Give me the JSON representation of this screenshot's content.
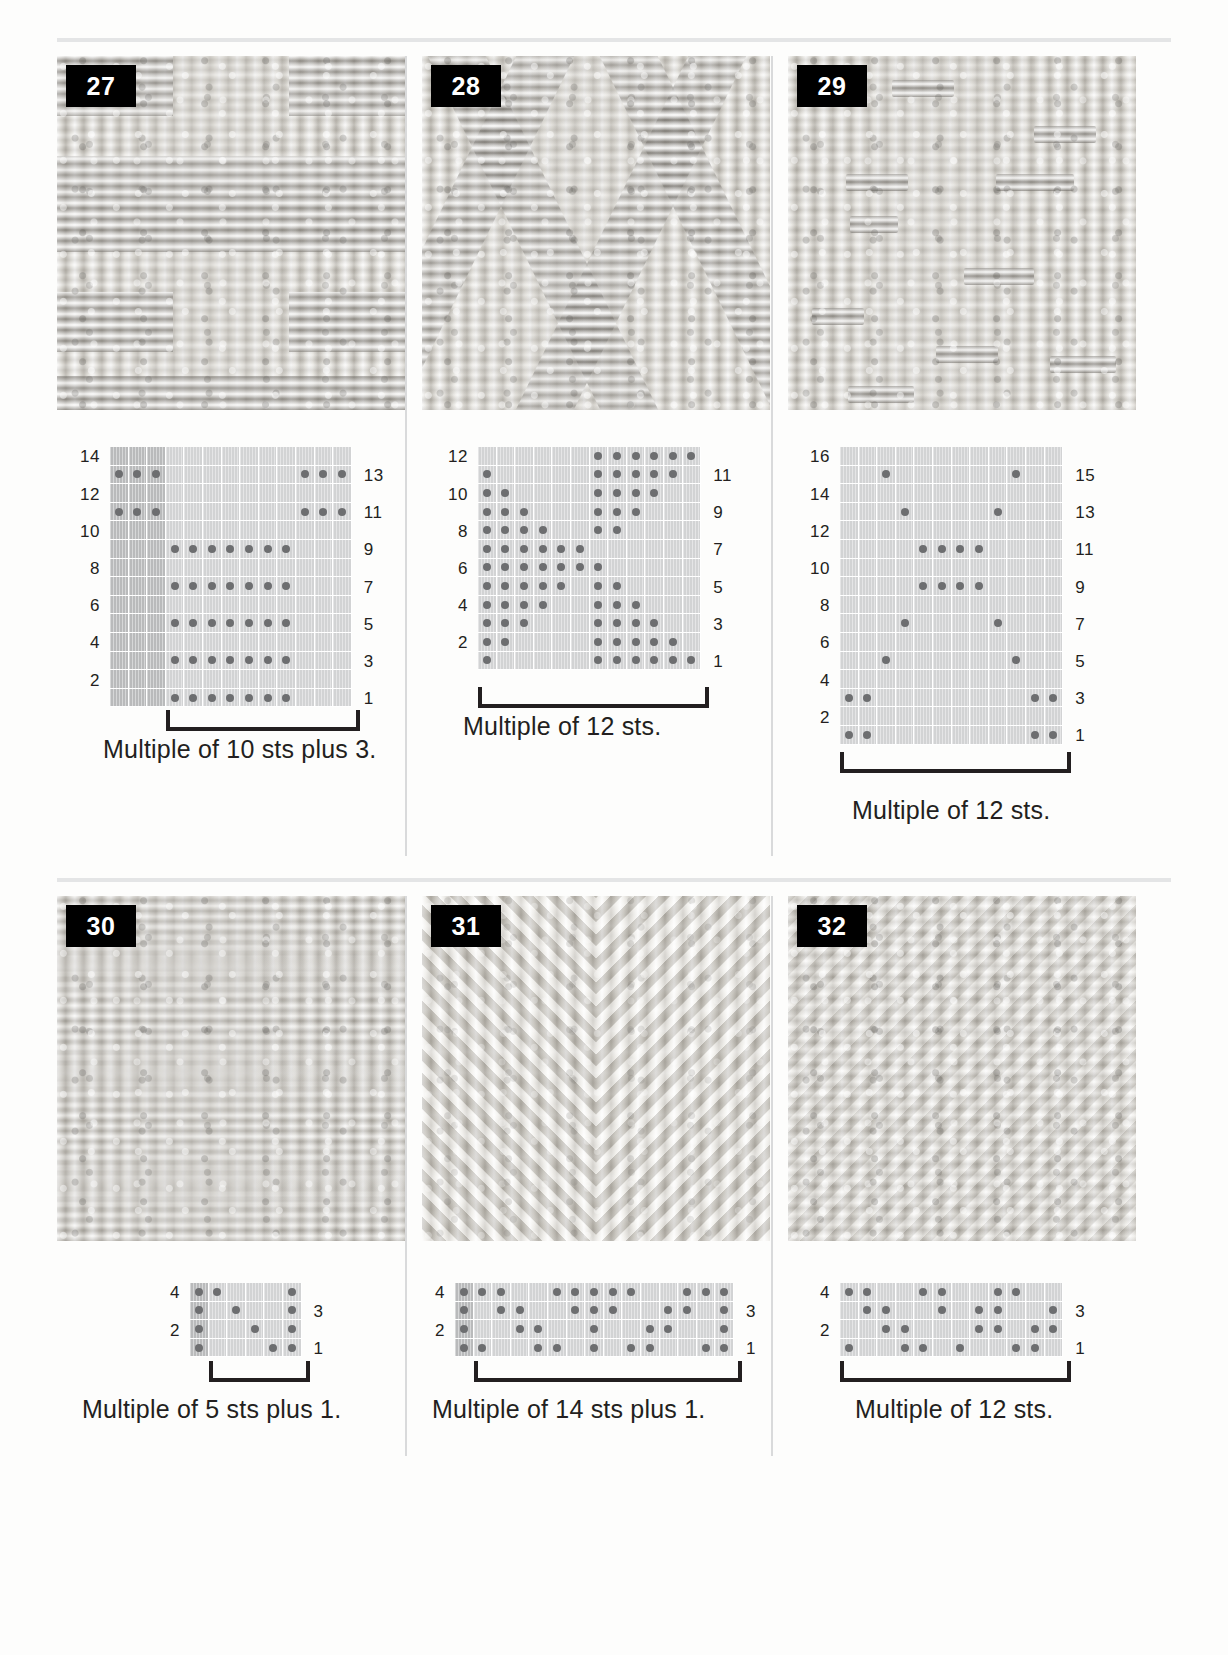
{
  "page": {
    "swatch_count": 6
  },
  "panels": [
    {
      "id": "panel-27",
      "number": "27",
      "caption": "Multiple of 10 sts plus 3.",
      "chart": {
        "columns": 13,
        "rows": 14,
        "shaded_columns": [
          1,
          2,
          3
        ],
        "left_labels": [
          "2",
          "4",
          "6",
          "8",
          "10",
          "12",
          "14"
        ],
        "right_labels": [
          "1",
          "3",
          "5",
          "7",
          "9",
          "11",
          "13"
        ],
        "repeat_start_col": 4,
        "repeat_end_col": 13,
        "dots": {
          "1": [
            4,
            5,
            6,
            7,
            8,
            9,
            10
          ],
          "2": [],
          "3": [
            4,
            5,
            6,
            7,
            8,
            9,
            10
          ],
          "4": [],
          "5": [
            4,
            5,
            6,
            7,
            8,
            9,
            10
          ],
          "6": [],
          "7": [
            4,
            5,
            6,
            7,
            8,
            9,
            10
          ],
          "8": [],
          "9": [
            4,
            5,
            6,
            7,
            8,
            9,
            10
          ],
          "10": [],
          "11": [
            1,
            2,
            3,
            11,
            12,
            13
          ],
          "12": [],
          "13": [
            1,
            2,
            3,
            11,
            12,
            13
          ],
          "14": []
        }
      }
    },
    {
      "id": "panel-28",
      "number": "28",
      "caption": "Multiple of 12 sts.",
      "chart": {
        "columns": 12,
        "rows": 12,
        "shaded_columns": [],
        "left_labels": [
          "2",
          "4",
          "6",
          "8",
          "10",
          "12"
        ],
        "right_labels": [
          "1",
          "3",
          "5",
          "7",
          "9",
          "11"
        ],
        "repeat_start_col": 1,
        "repeat_end_col": 12,
        "dots": {
          "1": [
            1,
            7,
            8,
            9,
            10,
            11,
            12
          ],
          "2": [
            1,
            2,
            7,
            8,
            9,
            10,
            11
          ],
          "3": [
            1,
            2,
            3,
            7,
            8,
            9,
            10
          ],
          "4": [
            1,
            2,
            3,
            4,
            7,
            8,
            9
          ],
          "5": [
            1,
            2,
            3,
            4,
            5,
            7,
            8
          ],
          "6": [
            1,
            2,
            3,
            4,
            5,
            6,
            7
          ],
          "7": [
            1,
            2,
            3,
            4,
            5,
            6
          ],
          "8": [
            1,
            2,
            3,
            4,
            7,
            8
          ],
          "9": [
            1,
            2,
            3,
            7,
            8,
            9
          ],
          "10": [
            1,
            2,
            7,
            8,
            9,
            10
          ],
          "11": [
            1,
            7,
            8,
            9,
            10,
            11
          ],
          "12": [
            7,
            8,
            9,
            10,
            11,
            12
          ]
        }
      }
    },
    {
      "id": "panel-29",
      "number": "29",
      "caption": "Multiple of 12 sts.",
      "chart": {
        "columns": 12,
        "rows": 16,
        "shaded_columns": [],
        "left_labels": [
          "2",
          "4",
          "6",
          "8",
          "10",
          "12",
          "14",
          "16"
        ],
        "right_labels": [
          "1",
          "3",
          "5",
          "7",
          "9",
          "11",
          "13",
          "15"
        ],
        "repeat_start_col": 1,
        "repeat_end_col": 12,
        "dots": {
          "1": [
            1,
            2,
            11,
            12
          ],
          "2": [],
          "3": [
            1,
            2,
            11,
            12
          ],
          "4": [],
          "5": [
            3,
            10
          ],
          "6": [],
          "7": [
            4,
            9
          ],
          "8": [],
          "9": [
            5,
            6,
            7,
            8
          ],
          "10": [],
          "11": [
            5,
            6,
            7,
            8
          ],
          "12": [],
          "13": [
            4,
            9
          ],
          "14": [],
          "15": [
            3,
            10
          ],
          "16": []
        }
      }
    },
    {
      "id": "panel-30",
      "number": "30",
      "caption": "Multiple of 5 sts plus 1.",
      "chart": {
        "columns": 6,
        "rows": 4,
        "shaded_columns": [
          1
        ],
        "left_labels": [
          "2",
          "4"
        ],
        "right_labels": [
          "1",
          "3"
        ],
        "repeat_start_col": 2,
        "repeat_end_col": 6,
        "dots": {
          "1": [
            1,
            5,
            6
          ],
          "2": [
            1,
            4,
            6
          ],
          "3": [
            1,
            3,
            6
          ],
          "4": [
            1,
            2,
            6
          ]
        }
      }
    },
    {
      "id": "panel-31",
      "number": "31",
      "caption": "Multiple of 14 sts plus 1.",
      "chart": {
        "columns": 15,
        "rows": 4,
        "shaded_columns": [
          1
        ],
        "left_labels": [
          "2",
          "4"
        ],
        "right_labels": [
          "1",
          "3"
        ],
        "repeat_start_col": 2,
        "repeat_end_col": 15,
        "dots": {
          "1": [
            1,
            2,
            5,
            6,
            8,
            10,
            11,
            14,
            15
          ],
          "2": [
            1,
            4,
            5,
            8,
            11,
            12,
            15
          ],
          "3": [
            1,
            3,
            4,
            7,
            8,
            9,
            12,
            13,
            15
          ],
          "4": [
            1,
            2,
            3,
            6,
            7,
            8,
            9,
            10,
            13,
            14,
            15
          ]
        }
      }
    },
    {
      "id": "panel-32",
      "number": "32",
      "caption": "Multiple of 12 sts.",
      "chart": {
        "columns": 12,
        "rows": 4,
        "shaded_columns": [],
        "left_labels": [
          "2",
          "4"
        ],
        "right_labels": [
          "1",
          "3"
        ],
        "repeat_start_col": 1,
        "repeat_end_col": 12,
        "dots": {
          "1": [
            1,
            4,
            5,
            7,
            10,
            11
          ],
          "2": [
            3,
            4,
            8,
            9,
            11,
            12
          ],
          "3": [
            2,
            3,
            6,
            8,
            9,
            12
          ],
          "4": [
            1,
            2,
            5,
            6,
            9,
            10
          ]
        }
      }
    }
  ]
}
